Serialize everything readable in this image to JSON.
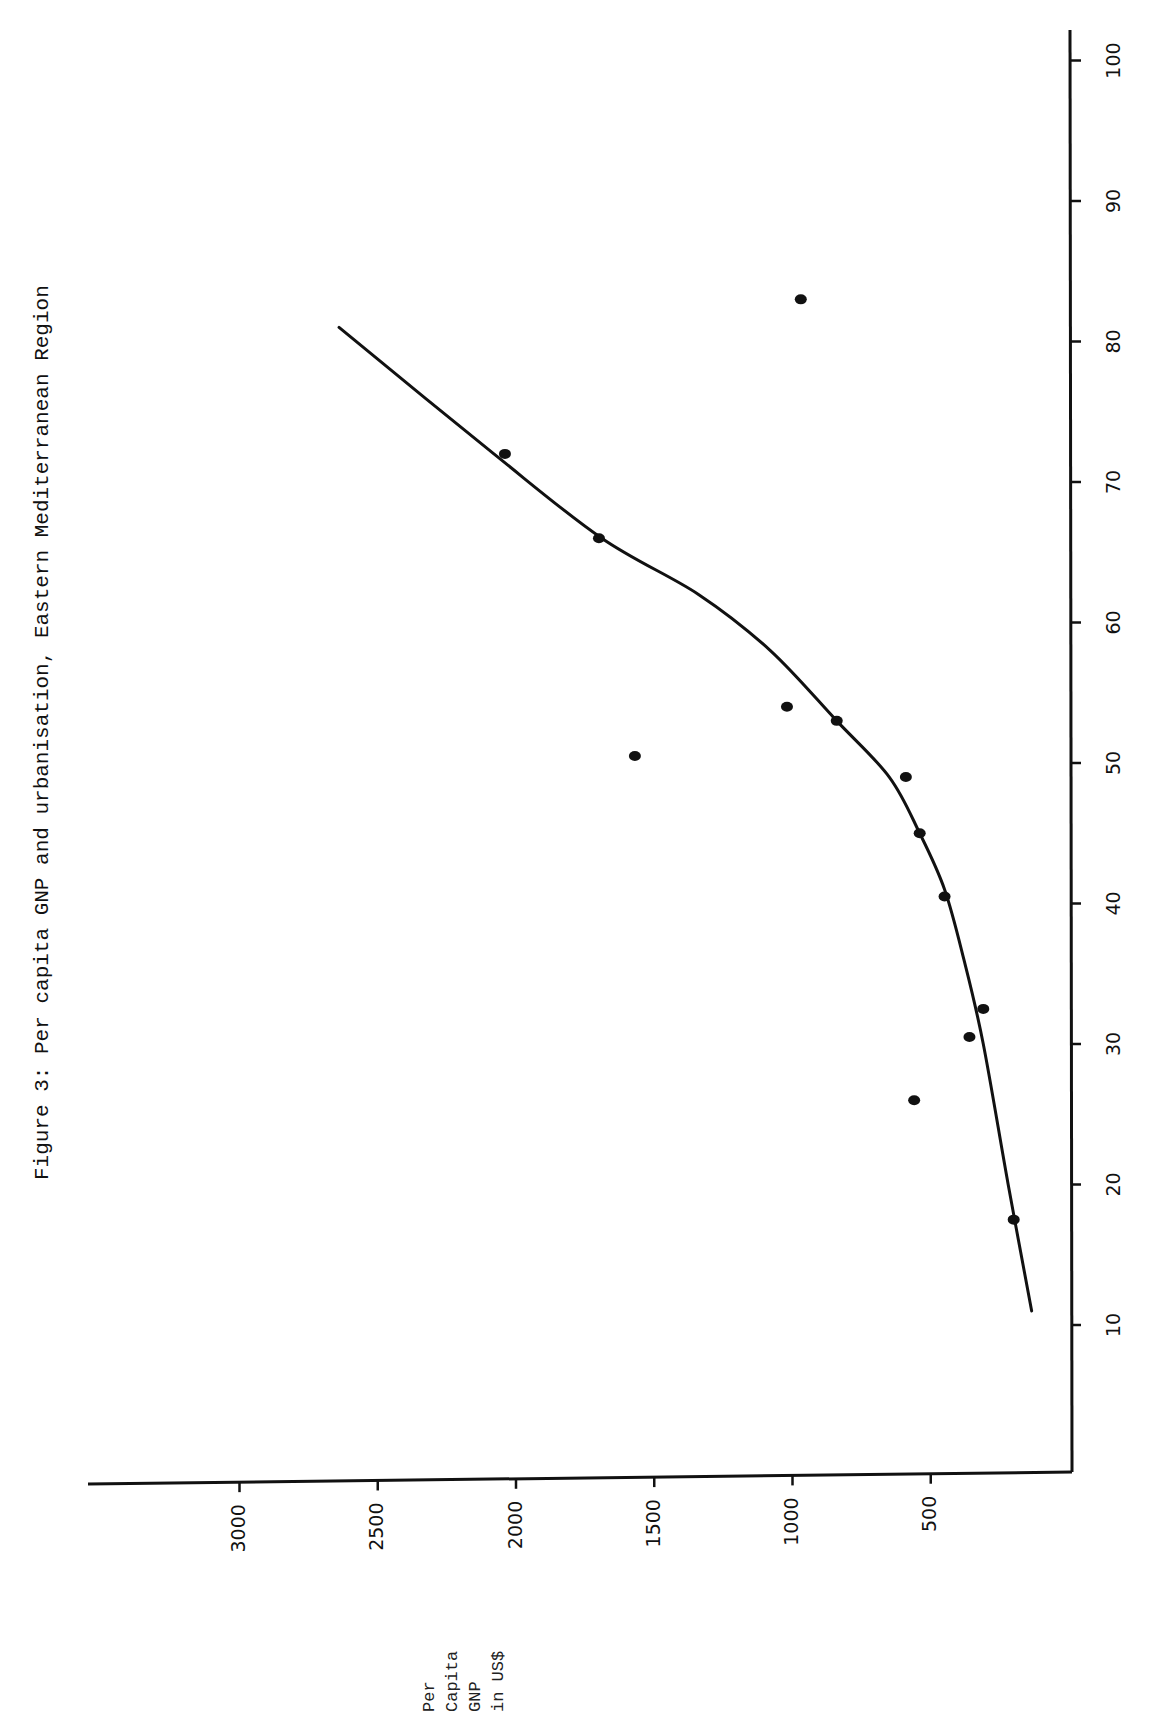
{
  "figure": {
    "title": "Figure 3:  Per capita GNP and urbanisation, Eastern Mediterranean Region"
  },
  "axes": {
    "gnp_axis_title_lines": [
      "Per",
      "Capita",
      "GNP",
      "in US$"
    ],
    "urbanisation_axis_title": ""
  },
  "colors": {
    "ink": "#111111",
    "background": "#ffffff"
  },
  "chart_data": {
    "type": "scatter",
    "title": "Figure 3:  Per capita GNP and urbanisation, Eastern Mediterranean Region",
    "orientation_note": "page rotated 90 degrees counter-clockwise",
    "xlabel": "Urbanisation (%)",
    "ylabel": "Per Capita GNP in US$",
    "x_ticks": [
      10,
      20,
      30,
      40,
      50,
      60,
      70,
      80,
      90,
      100
    ],
    "y_ticks": [
      500,
      1000,
      1500,
      2000,
      2500,
      3000
    ],
    "xlim": [
      0,
      100
    ],
    "ylim": [
      0,
      3400
    ],
    "grid": false,
    "legend": null,
    "points": [
      {
        "urbanisation": 17.5,
        "gnp": 200
      },
      {
        "urbanisation": 26,
        "gnp": 560
      },
      {
        "urbanisation": 30.5,
        "gnp": 360
      },
      {
        "urbanisation": 32.5,
        "gnp": 310
      },
      {
        "urbanisation": 40.5,
        "gnp": 450
      },
      {
        "urbanisation": 45,
        "gnp": 540
      },
      {
        "urbanisation": 49,
        "gnp": 590
      },
      {
        "urbanisation": 50.5,
        "gnp": 1570
      },
      {
        "urbanisation": 53,
        "gnp": 840
      },
      {
        "urbanisation": 54,
        "gnp": 1020
      },
      {
        "urbanisation": 66,
        "gnp": 1700
      },
      {
        "urbanisation": 72,
        "gnp": 2040
      },
      {
        "urbanisation": 83,
        "gnp": 970
      }
    ],
    "fitted_curve": {
      "name": "trend line (hand-fitted)",
      "points": [
        {
          "urbanisation": 11,
          "gnp": 135
        },
        {
          "urbanisation": 20,
          "gnp": 220
        },
        {
          "urbanisation": 30,
          "gnp": 310
        },
        {
          "urbanisation": 36,
          "gnp": 380
        },
        {
          "urbanisation": 41,
          "gnp": 450
        },
        {
          "urbanisation": 45,
          "gnp": 540
        },
        {
          "urbanisation": 49,
          "gnp": 650
        },
        {
          "urbanisation": 53,
          "gnp": 840
        },
        {
          "urbanisation": 58,
          "gnp": 1080
        },
        {
          "urbanisation": 62,
          "gnp": 1340
        },
        {
          "urbanisation": 66,
          "gnp": 1690
        },
        {
          "urbanisation": 72,
          "gnp": 2080
        },
        {
          "urbanisation": 81,
          "gnp": 2640
        }
      ]
    }
  }
}
